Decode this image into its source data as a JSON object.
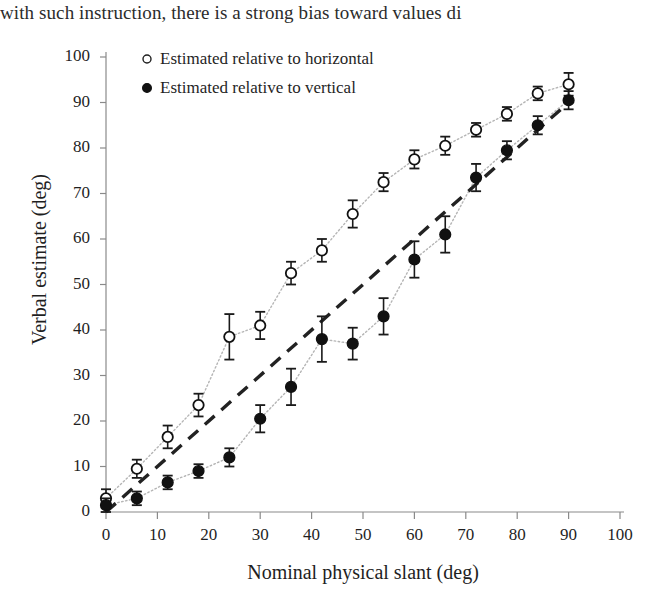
{
  "page_text_fragment": "with such instruction, there is a strong bias toward values di",
  "legend": {
    "items": [
      {
        "marker": "open-circle",
        "label": "Estimated relative to horizontal"
      },
      {
        "marker": "filled-circle",
        "label": "Estimated relative to vertical"
      }
    ]
  },
  "axes": {
    "x_title": "Nominal physical slant (deg)",
    "y_title": "Verbal estimate (deg)",
    "x_ticks": [
      "0",
      "10",
      "20",
      "30",
      "40",
      "50",
      "60",
      "70",
      "80",
      "90",
      "100"
    ],
    "y_ticks": [
      "0",
      "10",
      "20",
      "30",
      "40",
      "50",
      "60",
      "70",
      "80",
      "90",
      "100"
    ]
  },
  "colors": {
    "ink": "#1f1f1f",
    "axis": "#8a8a8a",
    "marker_fill_open": "#ffffff",
    "marker_fill_closed": "#111111",
    "trend_dotted": "#b5b5b5",
    "identity_dashed": "#222222"
  },
  "chart_data": {
    "type": "scatter",
    "title": "",
    "xlabel": "Nominal physical slant (deg)",
    "ylabel": "Verbal estimate (deg)",
    "xlim": [
      0,
      100
    ],
    "ylim": [
      0,
      100
    ],
    "xticks": [
      0,
      10,
      20,
      30,
      40,
      50,
      60,
      70,
      80,
      90,
      100
    ],
    "yticks": [
      0,
      10,
      20,
      30,
      40,
      50,
      60,
      70,
      80,
      90,
      100
    ],
    "grid": false,
    "legend_position": "top-left",
    "error_bars": "vertical",
    "reference_line": {
      "name": "identity",
      "style": "dashed",
      "x": [
        0,
        90
      ],
      "y": [
        0,
        90
      ]
    },
    "series": [
      {
        "name": "Estimated relative to horizontal",
        "marker": "open-circle",
        "line_style": "dotted",
        "x": [
          0,
          6,
          12,
          18,
          24,
          30,
          36,
          42,
          48,
          54,
          60,
          66,
          72,
          78,
          84,
          90
        ],
        "y": [
          3.0,
          9.5,
          16.5,
          23.5,
          38.5,
          41.0,
          52.5,
          57.5,
          65.5,
          72.5,
          77.5,
          80.5,
          84.0,
          87.5,
          92.0,
          94.0
        ],
        "yerr": [
          2.0,
          2.0,
          2.5,
          2.5,
          5.0,
          3.0,
          2.5,
          2.5,
          3.0,
          2.0,
          2.0,
          2.0,
          1.5,
          1.5,
          1.5,
          2.5
        ]
      },
      {
        "name": "Estimated relative to vertical",
        "marker": "filled-circle",
        "line_style": "dotted",
        "x": [
          0,
          6,
          12,
          18,
          24,
          30,
          36,
          42,
          48,
          54,
          60,
          66,
          72,
          78,
          84,
          90
        ],
        "y": [
          1.5,
          3.0,
          6.5,
          9.0,
          12.0,
          20.5,
          27.5,
          38.0,
          37.0,
          43.0,
          55.5,
          61.0,
          73.5,
          79.5,
          85.0,
          90.5
        ],
        "yerr": [
          1.5,
          1.5,
          1.5,
          1.5,
          2.0,
          3.0,
          4.0,
          5.0,
          3.5,
          4.0,
          4.0,
          4.0,
          3.0,
          2.0,
          2.0,
          2.0
        ]
      }
    ]
  }
}
